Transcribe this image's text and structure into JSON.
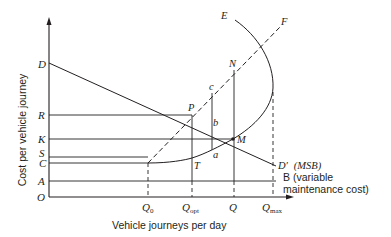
{
  "axes": {
    "y_label": "Cost per vehicle journey",
    "x_label": "Vehicle journeys per day",
    "origin_label": "O"
  },
  "y_labels": {
    "D": "D",
    "R": "R",
    "K": "K",
    "S": "S",
    "C": "C",
    "A": "A"
  },
  "x_labels": {
    "q0_main": "Q",
    "q0_sub": "0",
    "qopt_main": "Q",
    "qopt_sub": "opt",
    "q_main": "Q",
    "qmax_main": "Q",
    "qmax_sub": "max"
  },
  "points": {
    "E": "E",
    "F": "F",
    "N": "N",
    "c": "c",
    "P": "P",
    "b": "b",
    "M": "M",
    "a": "a",
    "T": "T"
  },
  "curves": {
    "demand_label": "D′",
    "demand_note": "(MSB)",
    "maintenance_label_1": "B (variable",
    "maintenance_label_2": "maintenance cost)"
  },
  "colors": {
    "ink": "#231f20",
    "background": "#ffffff"
  }
}
